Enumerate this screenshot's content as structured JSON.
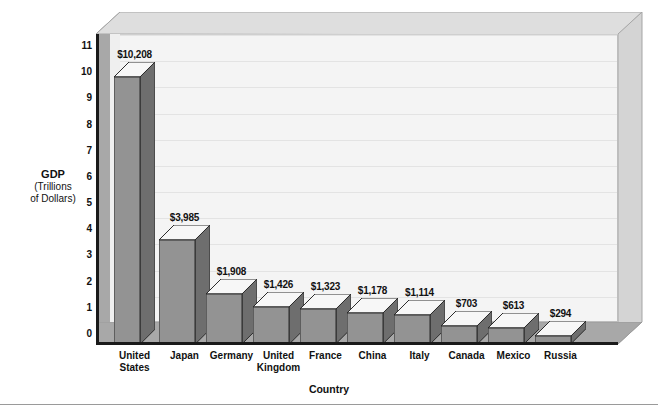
{
  "chart_data": {
    "type": "bar",
    "title": "",
    "xlabel": "Country",
    "ylabel": "GDP",
    "ylabel_sub": "(Trillions\nof Dollars)",
    "ylim": [
      0,
      11
    ],
    "yticks": [
      "11",
      "10",
      "9",
      "8",
      "7",
      "6",
      "5",
      "4",
      "3",
      "2",
      "1",
      "0"
    ],
    "ytick_values": [
      11,
      10,
      9,
      8,
      7,
      6,
      5,
      4,
      3,
      2,
      1,
      0
    ],
    "grid": true,
    "legend": "none",
    "units": "billions of dollars (labels) / trillions (axis)",
    "categories": [
      "United\nStates",
      "Japan",
      "Germany",
      "United\nKingdom",
      "France",
      "China",
      "Italy",
      "Canada",
      "Mexico",
      "Russia"
    ],
    "values": [
      10.208,
      3.985,
      1.908,
      1.426,
      1.323,
      1.178,
      1.114,
      0.703,
      0.613,
      0.294
    ],
    "data_labels": [
      "$10,208",
      "$3,985",
      "$1,908",
      "$1,426",
      "$1,323",
      "$1,178",
      "$1,114",
      "$703",
      "$613",
      "$294"
    ]
  },
  "colors": {
    "bar_front": "#939393",
    "bar_side": "#6e6e6e",
    "bar_top": "#f7f7f7",
    "plot_background": "#f4f4f4",
    "floor": "#a8a8a8",
    "frame_face": "#dcdcdc",
    "axis": "#1a1a1a",
    "gridline": "#e3e3e3",
    "text": "#111111"
  }
}
